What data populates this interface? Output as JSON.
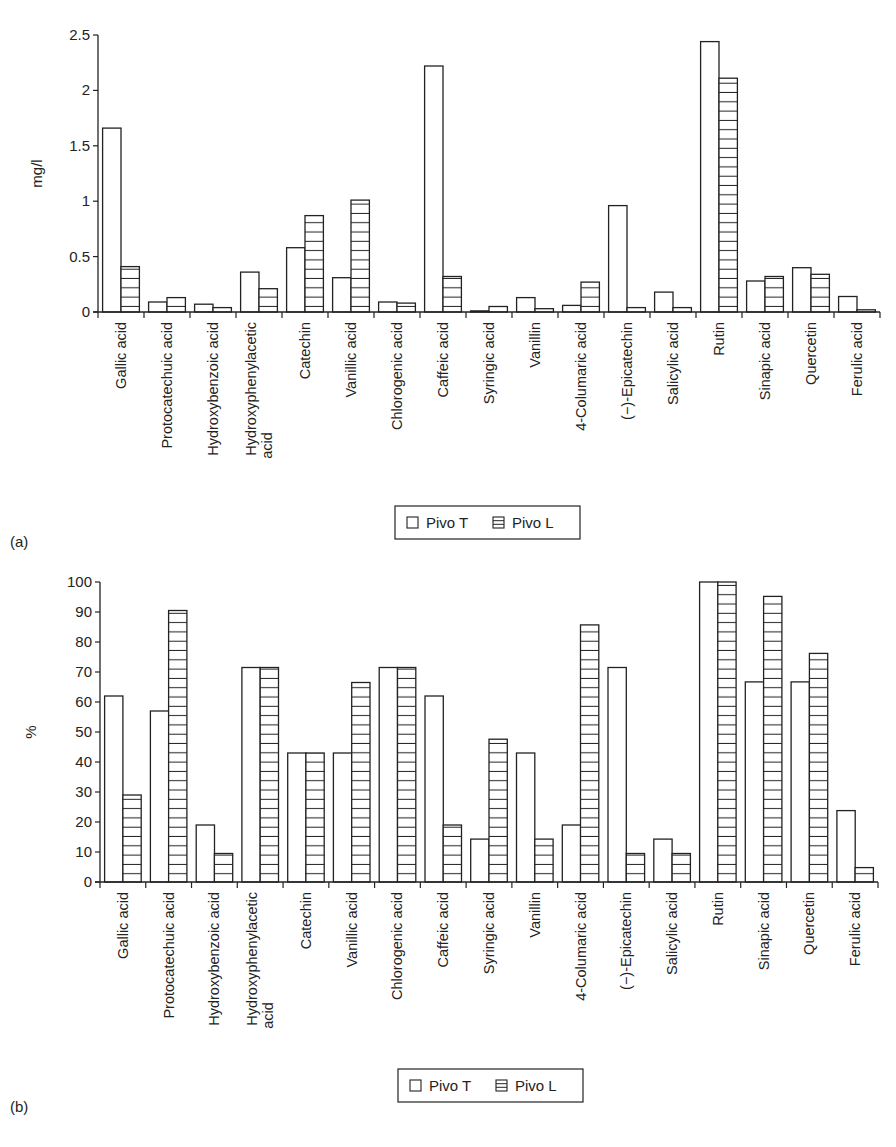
{
  "chart_data": [
    {
      "type": "bar",
      "panel_label": "(a)",
      "title": "",
      "xlabel": "",
      "ylabel": "mg/l",
      "ylim": [
        0,
        2.5
      ],
      "yticks": [
        "0",
        "0.5",
        "1",
        "1.5",
        "2",
        "2.5"
      ],
      "grid": false,
      "legend_position": "bottom-center",
      "categories": [
        "Gallic acid",
        "Protocatechuic acid",
        "Hydroxybenzoic acid",
        "Hydroxyphenylacetic acid",
        "Catechin",
        "Vanillic acid",
        "Chlorogenic acid",
        "Caffeic acid",
        "Syringic acid",
        "Vanillin",
        "4-Columaric acid",
        "(−)-Epicatechin",
        "Salicylic acid",
        "Rutin",
        "Sinapic acid",
        "Quercetin",
        "Ferulic acid"
      ],
      "series": [
        {
          "name": "Pivo T",
          "pattern": "empty",
          "values": [
            1.66,
            0.09,
            0.07,
            0.36,
            0.58,
            0.31,
            0.09,
            2.22,
            0.01,
            0.13,
            0.06,
            0.96,
            0.18,
            2.44,
            0.28,
            0.4,
            0.14
          ]
        },
        {
          "name": "Pivo L",
          "pattern": "horizontal-lines",
          "values": [
            0.41,
            0.13,
            0.04,
            0.21,
            0.87,
            1.01,
            0.08,
            0.32,
            0.05,
            0.03,
            0.27,
            0.04,
            0.04,
            2.11,
            0.32,
            0.34,
            0.02
          ]
        }
      ]
    },
    {
      "type": "bar",
      "panel_label": "(b)",
      "title": "",
      "xlabel": "",
      "ylabel": "%",
      "ylim": [
        0,
        100
      ],
      "yticks": [
        "0",
        "10",
        "20",
        "30",
        "40",
        "50",
        "60",
        "70",
        "80",
        "90",
        "100"
      ],
      "grid": false,
      "legend_position": "bottom-center",
      "categories": [
        "Gallic acid",
        "Protocatechuic acid",
        "Hydroxybenzoic acid",
        "Hydroxyphenylacetic acid",
        "Catechin",
        "Vanillic acid",
        "Chlorogenic acid",
        "Caffeic acid",
        "Syringic acid",
        "Vanillin",
        "4-Columaric acid",
        "(−)-Epicatechin",
        "Salicylic acid",
        "Rutin",
        "Sinapic acid",
        "Quercetin",
        "Ferulic acid"
      ],
      "series": [
        {
          "name": "Pivo T",
          "pattern": "empty",
          "values": [
            62,
            57,
            19,
            71.5,
            43,
            43,
            71.5,
            62,
            14.3,
            43,
            19,
            71.5,
            14.3,
            100,
            66.7,
            66.7,
            23.8
          ]
        },
        {
          "name": "Pivo L",
          "pattern": "horizontal-lines",
          "values": [
            29,
            90.5,
            9.5,
            71.5,
            43,
            66.5,
            71.5,
            19,
            47.6,
            14.3,
            85.7,
            9.5,
            9.5,
            100,
            95.2,
            76.2,
            4.8
          ]
        }
      ]
    }
  ],
  "labels": {
    "category_lines": [
      [
        "Gallic acid"
      ],
      [
        "Protocatechuic acid"
      ],
      [
        "Hydroxybenzoic acid"
      ],
      [
        "Hydroxyphenylacetic",
        "acid"
      ],
      [
        "Catechin"
      ],
      [
        "Vanillic acid"
      ],
      [
        "Chlorogenic acid"
      ],
      [
        "Caffeic acid"
      ],
      [
        "Syringic acid"
      ],
      [
        "Vanillin"
      ],
      [
        "4-Columaric acid"
      ],
      [
        "(−)-Epicatechin"
      ],
      [
        "Salicylic acid"
      ],
      [
        "Rutin"
      ],
      [
        "Sinapic acid"
      ],
      [
        "Quercetin"
      ],
      [
        "Ferulic acid"
      ]
    ],
    "legend_t": "Pivo T",
    "legend_l": "Pivo L"
  },
  "colors": {
    "stroke": "#222222",
    "fill": "#ffffff",
    "text": "#222222"
  }
}
